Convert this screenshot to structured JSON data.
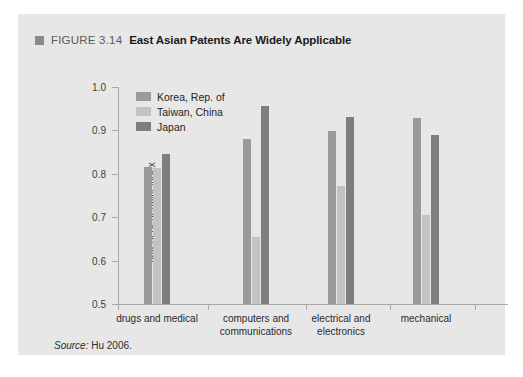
{
  "figure": {
    "bullet_icon": "square-bullet-icon",
    "number": "FIGURE 3.14",
    "title": "East Asian Patents Are Widely Applicable",
    "source_prefix": "Source:",
    "source_text": "Hu 2006."
  },
  "colors": {
    "panel_background": "#e7e7e7",
    "page_background": "#ffffff",
    "axis": "#a8a8a8",
    "korea": "#9a9a9a",
    "taiwan": "#c3c3c3",
    "japan": "#7e7e7e",
    "title_text": "#1b1b1b",
    "label_text": "#2b2b2b"
  },
  "chart_data": {
    "type": "bar",
    "title": "East Asian Patents Are Widely Applicable",
    "xlabel": "",
    "ylabel": "patent generality index",
    "ylim": [
      0.5,
      1.0
    ],
    "yticks": [
      "0.5",
      "0.6",
      "0.7",
      "0.8",
      "0.9",
      "1.0"
    ],
    "ytick_values": [
      0.5,
      0.6,
      0.7,
      0.8,
      0.9,
      1.0
    ],
    "grid": false,
    "legend_position": "upper-left-inside",
    "categories": [
      "drugs and medical",
      "computers and communications",
      "electrical and electronics",
      "mechanical"
    ],
    "category_lines": [
      [
        "drugs and medical"
      ],
      [
        "computers and",
        "communications"
      ],
      [
        "electrical and",
        "electronics"
      ],
      [
        "mechanical"
      ]
    ],
    "series": [
      {
        "name": "Korea, Rep. of",
        "color": "#9a9a9a",
        "values": [
          0.815,
          0.88,
          0.898,
          0.928
        ]
      },
      {
        "name": "Taiwan, China",
        "color": "#c3c3c3",
        "values": [
          0.813,
          0.655,
          0.773,
          0.705
        ]
      },
      {
        "name": "Japan",
        "color": "#7e7e7e",
        "values": [
          0.845,
          0.957,
          0.93,
          0.889
        ]
      }
    ],
    "source": "Source: Hu 2006."
  }
}
